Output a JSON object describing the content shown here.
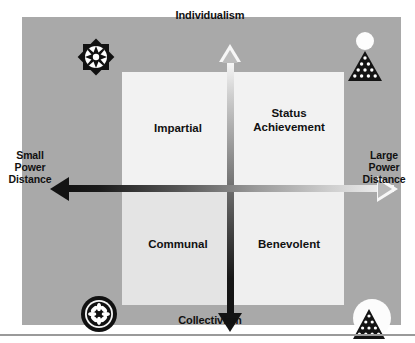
{
  "diagram": {
    "axes": {
      "vertical": {
        "top_label": "Individualism",
        "bottom_label": "Collectivism"
      },
      "horizontal": {
        "left_label": "Small\nPower\nDistance",
        "left_label_lines": [
          "Small",
          "Power",
          "Distance"
        ],
        "right_label": "Large\nPower\nDistance",
        "right_label_lines": [
          "Large",
          "Power",
          "Distance"
        ]
      }
    },
    "quadrants": [
      {
        "id": "top-left",
        "label": "Impartial",
        "label_lines": [
          "Impartial"
        ]
      },
      {
        "id": "top-right",
        "label": "Status Achievement",
        "label_lines": [
          "Status",
          "Achievement"
        ]
      },
      {
        "id": "bottom-left",
        "label": "Communal",
        "label_lines": [
          "Communal"
        ]
      },
      {
        "id": "bottom-right",
        "label": "Benevolent",
        "label_lines": [
          "Benevolent"
        ]
      }
    ],
    "corner_icons": [
      {
        "id": "top-left",
        "name": "compass-star-icon",
        "description": "dark eight-point star burst with white center"
      },
      {
        "id": "top-right",
        "name": "circle-over-pyramid-icon",
        "description": "white circle above dark dotted pyramid"
      },
      {
        "id": "bottom-left",
        "name": "flower-in-circle-icon",
        "description": "dark filled circle with white petal rosette"
      },
      {
        "id": "bottom-right",
        "name": "pyramid-on-circle-icon",
        "description": "dark dotted pyramid over white circle"
      }
    ],
    "colors": {
      "panel_background": "#a9a9a9",
      "field_background": "#f2f2f2",
      "page_background": "#ffffff",
      "axis_dark": "#131313",
      "axis_light": "#f7f7f7",
      "text": "#111111"
    }
  }
}
